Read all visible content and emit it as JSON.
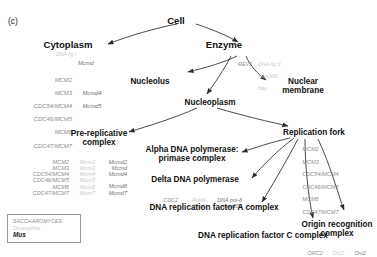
{
  "panel": {
    "tag": "(c)"
  },
  "legend": {
    "rows": [
      {
        "name": "SACCHAROMYCES",
        "style": "sac"
      },
      {
        "name": "Drosophila",
        "style": "dro"
      },
      {
        "name": "Mus",
        "style": "mus"
      }
    ]
  },
  "colors": {
    "saccharomyces": "#8d8d8d",
    "drosophila": "#c9c9c9",
    "mus": "#6f6f6f",
    "label": "#101010",
    "arrow": "#2b2b2b"
  },
  "nodes": {
    "cell": "Cell",
    "cytoplasm": "Cytoplasm",
    "enzyme": "Enzyme",
    "nucleolus": "Nucleolus",
    "nuclear_membrane_1": "Nuclear",
    "nuclear_membrane_2": "membrane",
    "nucleoplasm": "Nucleoplasm",
    "prereplicative_1": "Pre-replicative",
    "prereplicative_2": "complex",
    "replication_fork": "Replication fork",
    "alpha_pol_1": "Alpha DNA polymerase:",
    "alpha_pol_2": "primase complex",
    "delta_pol": "Delta DNA polymerase",
    "rfa": "DNA replication factor A complex",
    "rfc": "DNA replication factor C complex",
    "orc_1": "Origin recognition",
    "orc_2": "complex"
  },
  "gene_lists": {
    "cytoplasm": {
      "sac": [
        "MCM2",
        "MCM3",
        "CDC54/MCM4",
        "CDC46/MCM5",
        "MCM6",
        "CDC47/MCM7"
      ],
      "dro_top": "DNA lig I",
      "mus_top": "Mcmd",
      "mus": [
        "",
        "",
        "Mcmd4",
        "Mcmd5",
        "",
        ""
      ]
    },
    "enzyme": {
      "sac": [
        "REV3"
      ],
      "dro": [
        "DNA lig II",
        "mus308",
        "hay"
      ]
    },
    "prereplicative": {
      "sac": [
        "MCM2",
        "MCM3",
        "CDC54/MCM4",
        "CDC46/MCM5",
        "MCM6",
        "CDC47/MCM7"
      ],
      "dro": [
        "Mcm2",
        "Mcm3",
        "Mcm4",
        "Mcm5",
        "Mcm6",
        "Mcm7"
      ],
      "mus": [
        "Mcmd2",
        "Mcmd",
        "Mcmd4",
        "",
        "Mcmd6",
        "Mcmd7"
      ]
    },
    "delta_pol": {
      "sac": [
        "CDC2",
        ""
      ],
      "dro": [
        "Pold1",
        "Pold2"
      ],
      "mus": [
        "DNA pol-δ",
        "mus209"
      ]
    },
    "replication_fork": {
      "sac": [
        "MCM2",
        "MCM3",
        "CDC54/MCM4",
        "CDC46/MCM5",
        "MCM6",
        "CDC47/MCM7"
      ]
    },
    "orc": {
      "sac": [
        "ORC2"
      ],
      "dro": [
        "Orc2"
      ],
      "mus": [
        "Orc2"
      ]
    }
  }
}
